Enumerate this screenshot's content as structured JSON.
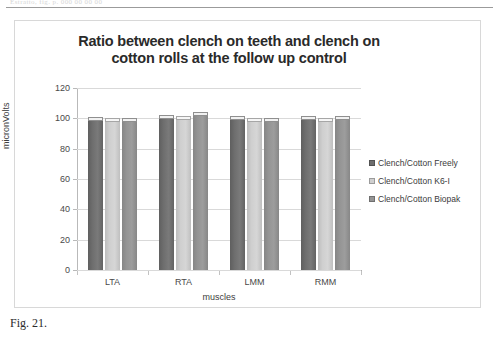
{
  "page": {
    "top_scan_text": "Estratto, fig. p. 000 00 00 00",
    "caption": "Fig. 21."
  },
  "chart_data": {
    "type": "bar",
    "title": "Ratio between clench on teeth and clench on cotton rolls at the follow up control",
    "title_line1": "Ratio between clench on teeth and clench on",
    "title_line2": "cotton rolls at the follow up control",
    "xlabel": "muscles",
    "ylabel": "micronVolts",
    "categories": [
      "LTA",
      "RTA",
      "LMM",
      "RMM"
    ],
    "ylim": [
      0,
      120
    ],
    "yticks": [
      0,
      20,
      40,
      60,
      80,
      100,
      120
    ],
    "ytick_labels": [
      "0",
      "20",
      "40",
      "60",
      "80",
      "100",
      "120"
    ],
    "grid": true,
    "legend_position": "right",
    "series": [
      {
        "name": "Clench/Cotton Freely",
        "color": "#6e6e6e",
        "values": [
          101,
          102,
          101.5,
          101.5
        ]
      },
      {
        "name": "Clench/Cotton K6-I",
        "color": "#cfcfcf",
        "values": [
          100,
          101.5,
          100,
          100.5
        ]
      },
      {
        "name": "Clench/Cotton Biopak",
        "color": "#949494",
        "values": [
          100.5,
          104.5,
          100.5,
          101.5
        ]
      }
    ]
  }
}
